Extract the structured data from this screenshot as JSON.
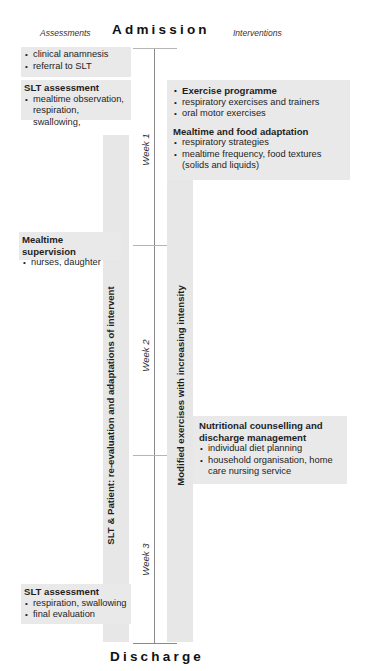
{
  "header": {
    "assessments_label": "Assessments",
    "admission_label": "Admission",
    "interventions_label": "Interventions"
  },
  "footer": {
    "discharge_label": "Discharge"
  },
  "timeline": {
    "weeks": [
      "Week 1",
      "Week 2",
      "Week 3"
    ]
  },
  "columns": {
    "left_vertical": "SLT & Patient:  re-evaluation and adaptations of intervent",
    "right_vertical": "Modified exercises with increasing intensity"
  },
  "assessments": [
    {
      "title": "",
      "items": [
        "clinical anamnesis",
        "referral to SLT"
      ]
    },
    {
      "title": "SLT assessment",
      "items": [
        "mealtime observation, respiration, swallowing,"
      ]
    },
    {
      "title": "Mealtime supervision",
      "items": [
        "nurses, daughter"
      ]
    },
    {
      "title": "SLT assessment",
      "items": [
        "respiration, swallowing",
        "final evaluation"
      ]
    }
  ],
  "interventions": [
    {
      "groups": [
        {
          "title": "",
          "items": [
            "Exercise programme",
            "respiratory exercises and trainers",
            "oral motor exercises"
          ]
        },
        {
          "title": "Mealtime and food adaptation",
          "items": [
            "respiratory strategies",
            "mealtime frequency, food textures (solids and liquids)"
          ]
        }
      ]
    },
    {
      "groups": [
        {
          "title": "Nutritional counselling and discharge management",
          "items": [
            "individual diet planning",
            "household organisation, home care nursing service"
          ]
        }
      ]
    }
  ]
}
